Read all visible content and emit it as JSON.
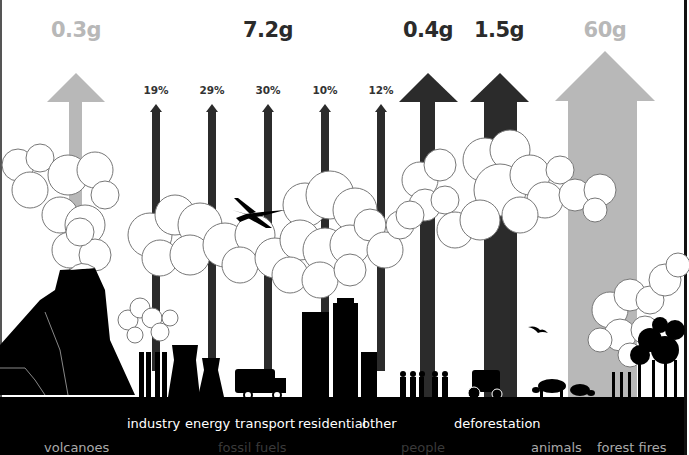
{
  "colors": {
    "natural": "#b8b8b8",
    "human": "#2b2b2b",
    "ground": "#000000",
    "background": "#ffffff",
    "label_bright": "#aaaaaa",
    "label_dim": "#3a3a3a",
    "label_white": "#ffffff"
  },
  "emissions": [
    {
      "id": "volcanoes",
      "value": "0.3g",
      "category": "volcanoes",
      "type": "natural"
    },
    {
      "id": "fossil_fuels",
      "value": "7.2g",
      "category": "fossil fuels",
      "type": "human"
    },
    {
      "id": "people",
      "value": "0.4g",
      "category": "people",
      "type": "human"
    },
    {
      "id": "deforestation",
      "value": "1.5g",
      "category": "deforestation",
      "type": "human"
    },
    {
      "id": "forest_fires",
      "value": "60g",
      "category": "forest fires",
      "type": "natural"
    }
  ],
  "fossil_fuel_breakdown": [
    {
      "label": "industry",
      "share": "19%"
    },
    {
      "label": "energy",
      "share": "29%"
    },
    {
      "label": "transport",
      "share": "30%"
    },
    {
      "label": "residential",
      "share": "10%"
    },
    {
      "label": "other",
      "share": "12%"
    }
  ],
  "bottom_labels": {
    "volcanoes": "volcanoes",
    "fossil_fuels": "fossil fuels",
    "people": "people",
    "animals": "animals",
    "forest_fires": "forest fires",
    "deforestation": "deforestation"
  },
  "icons": [
    "volcano-icon",
    "factory-icon",
    "cooling-tower-icon",
    "truck-icon",
    "airplane-icon",
    "skyscraper-icon",
    "people-icon",
    "tractor-icon",
    "bird-icon",
    "cow-icon",
    "pig-icon",
    "tree-icon",
    "cloud-icon"
  ]
}
